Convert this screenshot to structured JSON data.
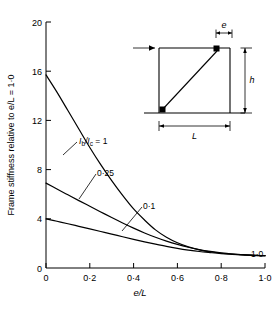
{
  "chart_data": {
    "type": "line",
    "title": "",
    "xlabel": "e/L",
    "ylabel": "Frame stiffness relative to e/L = 1·0",
    "xlim": [
      0,
      1.0
    ],
    "ylim": [
      0,
      20
    ],
    "grid": false,
    "legend_position": "inline-annotations",
    "x_ticks": [
      "0",
      "0·2",
      "0·4",
      "0·6",
      "0·8",
      "1·0"
    ],
    "x_tick_values": [
      0,
      0.2,
      0.4,
      0.6,
      0.8,
      1.0
    ],
    "y_ticks": [
      "0",
      "4",
      "8",
      "12",
      "16",
      "20"
    ],
    "y_tick_values": [
      0,
      4,
      8,
      12,
      16,
      20
    ],
    "x": [
      0,
      0.05,
      0.1,
      0.15,
      0.2,
      0.25,
      0.3,
      0.35,
      0.4,
      0.45,
      0.5,
      0.55,
      0.6,
      0.65,
      0.7,
      0.75,
      0.8,
      0.85,
      0.9,
      0.95,
      1.0
    ],
    "series": [
      {
        "name": "Ib/Ic = 1",
        "label": "1",
        "values": [
          15.7,
          14.3,
          12.8,
          11.3,
          9.8,
          8.4,
          7.1,
          5.9,
          4.8,
          3.9,
          3.1,
          2.5,
          2.05,
          1.72,
          1.48,
          1.32,
          1.2,
          1.12,
          1.07,
          1.03,
          1.0
        ]
      },
      {
        "name": "Ib/Ic = 0·25",
        "label": "0·25",
        "values": [
          6.9,
          6.42,
          5.95,
          5.48,
          5.02,
          4.56,
          4.1,
          3.66,
          3.24,
          2.85,
          2.5,
          2.19,
          1.92,
          1.69,
          1.5,
          1.35,
          1.23,
          1.14,
          1.08,
          1.03,
          1.0
        ]
      },
      {
        "name": "Ib/Ic = 0·1",
        "label": "0·1",
        "values": [
          4.0,
          3.8,
          3.6,
          3.39,
          3.18,
          2.97,
          2.76,
          2.54,
          2.33,
          2.13,
          1.94,
          1.76,
          1.6,
          1.46,
          1.34,
          1.25,
          1.17,
          1.11,
          1.06,
          1.02,
          1.0
        ]
      }
    ],
    "annotations": [
      {
        "name": "curve-label-1",
        "text_prefix": "I",
        "text_sub1": "b",
        "text_mid": "/I",
        "text_sub2": "c",
        "text_suffix": " = 1",
        "full_text": "Ib/Ic = 1"
      },
      {
        "name": "curve-label-025",
        "full_text": "0·25"
      },
      {
        "name": "curve-label-01",
        "full_text": "0·1"
      },
      {
        "name": "asymptote-label",
        "full_text": "1·0"
      }
    ]
  },
  "inset": {
    "name": "frame-diagram",
    "dimension_e": "e",
    "dimension_h": "h",
    "dimension_L": "L",
    "load_arrow": "load-arrow"
  }
}
